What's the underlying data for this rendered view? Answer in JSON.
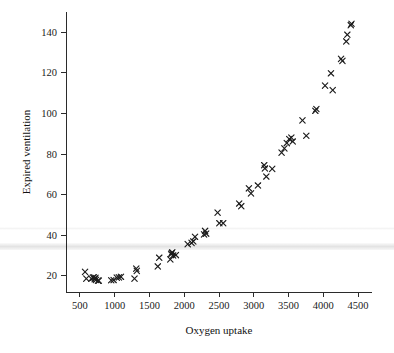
{
  "chart_data": {
    "type": "scatter",
    "title": "",
    "xlabel": "Oxygen uptake",
    "ylabel": "Expired ventilation",
    "xlim": [
      300,
      4700
    ],
    "ylim": [
      12,
      150
    ],
    "xticks": [
      500,
      1000,
      1500,
      2000,
      2500,
      3000,
      3500,
      4000,
      4500
    ],
    "yticks": [
      20,
      40,
      60,
      80,
      100,
      120,
      140
    ],
    "grid": false,
    "legend": null,
    "marker": "x",
    "marker_color": "#1c1c1c",
    "series": [
      {
        "name": "observations",
        "points": [
          [
            574,
            21.9
          ],
          [
            592,
            18.6
          ],
          [
            664,
            18.6
          ],
          [
            688,
            19.1
          ],
          [
            700,
            19.2
          ],
          [
            712,
            18.3
          ],
          [
            724,
            19.0
          ],
          [
            731,
            18.0
          ],
          [
            760,
            17.6
          ],
          [
            772,
            17.6
          ],
          [
            950,
            17.8
          ],
          [
            985,
            17.9
          ],
          [
            1030,
            19.1
          ],
          [
            1060,
            19.2
          ],
          [
            1090,
            19.5
          ],
          [
            1285,
            18.6
          ],
          [
            1310,
            23.5
          ],
          [
            1318,
            22.4
          ],
          [
            1620,
            24.6
          ],
          [
            1640,
            28.9
          ],
          [
            1800,
            28.1
          ],
          [
            1812,
            30.6
          ],
          [
            1820,
            31.2
          ],
          [
            1828,
            31.6
          ],
          [
            1840,
            30.0
          ],
          [
            1880,
            30.2
          ],
          [
            2050,
            35.6
          ],
          [
            2105,
            36.2
          ],
          [
            2130,
            36.9
          ],
          [
            2155,
            39.2
          ],
          [
            2285,
            40.4
          ],
          [
            2300,
            42.1
          ],
          [
            2315,
            40.8
          ],
          [
            2480,
            51.1
          ],
          [
            2505,
            45.9
          ],
          [
            2560,
            45.9
          ],
          [
            2790,
            55.6
          ],
          [
            2820,
            54.3
          ],
          [
            2930,
            63.1
          ],
          [
            2960,
            60.6
          ],
          [
            3060,
            64.5
          ],
          [
            3150,
            74.5
          ],
          [
            3160,
            72.9
          ],
          [
            3180,
            68.9
          ],
          [
            3265,
            72.7
          ],
          [
            3400,
            80.7
          ],
          [
            3440,
            82.8
          ],
          [
            3475,
            85.4
          ],
          [
            3510,
            87.4
          ],
          [
            3540,
            88.1
          ],
          [
            3560,
            86.2
          ],
          [
            3700,
            96.6
          ],
          [
            3755,
            89.0
          ],
          [
            3885,
            101.3
          ],
          [
            3900,
            102.2
          ],
          [
            4025,
            113.7
          ],
          [
            4110,
            119.8
          ],
          [
            4135,
            111.5
          ],
          [
            4255,
            126.9
          ],
          [
            4275,
            125.9
          ],
          [
            4330,
            135.5
          ],
          [
            4345,
            138.8
          ],
          [
            4395,
            143.5
          ],
          [
            4405,
            144.2
          ]
        ]
      }
    ]
  }
}
